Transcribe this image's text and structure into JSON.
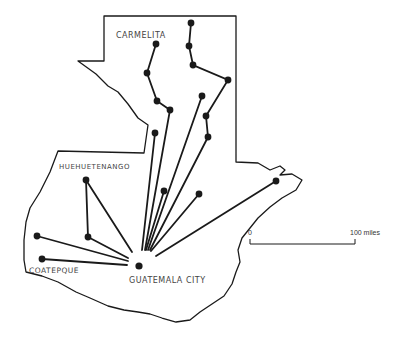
{
  "map": {
    "title": "",
    "places": {
      "carmelita": "CARMELITA",
      "huehuetenango": "HUEHUETENANGO",
      "coatepque": "COATEPQUE",
      "guatemala_city": "GUATEMALA CITY"
    },
    "scale_bar": {
      "start_label": "0",
      "end_label": "100 miles"
    },
    "colors": {
      "ink": "#1a1a1a",
      "label": "#444444",
      "background": "#ffffff"
    },
    "hub": {
      "name": "GUATEMALA CITY",
      "x": 139,
      "y": 265
    },
    "nodes": [
      {
        "x": 156,
        "y": 44
      },
      {
        "x": 147,
        "y": 73
      },
      {
        "x": 157,
        "y": 101
      },
      {
        "x": 170,
        "y": 110
      },
      {
        "x": 191,
        "y": 23
      },
      {
        "x": 189,
        "y": 46
      },
      {
        "x": 193,
        "y": 65
      },
      {
        "x": 228,
        "y": 80
      },
      {
        "x": 206,
        "y": 116
      },
      {
        "x": 208,
        "y": 137
      },
      {
        "x": 202,
        "y": 96
      },
      {
        "x": 155,
        "y": 133
      },
      {
        "x": 86,
        "y": 180
      },
      {
        "x": 88,
        "y": 237
      },
      {
        "x": 37,
        "y": 236
      },
      {
        "x": 42,
        "y": 259
      },
      {
        "x": 164,
        "y": 191
      },
      {
        "x": 199,
        "y": 194
      },
      {
        "x": 276,
        "y": 181
      }
    ]
  }
}
